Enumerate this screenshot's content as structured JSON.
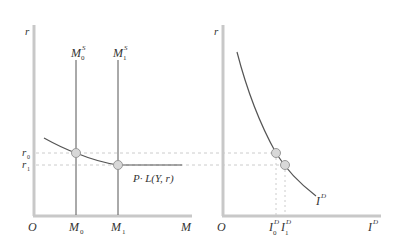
{
  "colors": {
    "axis": "#c8c8c8",
    "curve": "#555555",
    "dashed": "#cccccc",
    "point_fill": "#d8d8d8",
    "point_stroke": "#999999",
    "text": "#333333"
  },
  "left_panel": {
    "y_axis_label": "r",
    "x_axis_label": "M",
    "origin_label": "O",
    "supply_0": {
      "main": "M",
      "sup": "S",
      "sub": "0"
    },
    "supply_1": {
      "main": "M",
      "sup": "S",
      "sub": "1"
    },
    "r0": {
      "main": "r",
      "sub": "0"
    },
    "r1": {
      "main": "r",
      "sub": "1"
    },
    "m0": {
      "main": "M",
      "sub": "0"
    },
    "m1": {
      "main": "M",
      "sub": "1"
    },
    "demand_label": "P· L(Y, r)"
  },
  "right_panel": {
    "y_axis_label": "r",
    "x_axis_label": {
      "main": "I",
      "sup": "D"
    },
    "origin_label": "O",
    "curve_label": {
      "main": "I",
      "sup": "D"
    },
    "i0": {
      "main": "I",
      "sup": "D",
      "sub": "0"
    },
    "i1": {
      "main": "I",
      "sup": "D",
      "sub": "1"
    }
  }
}
